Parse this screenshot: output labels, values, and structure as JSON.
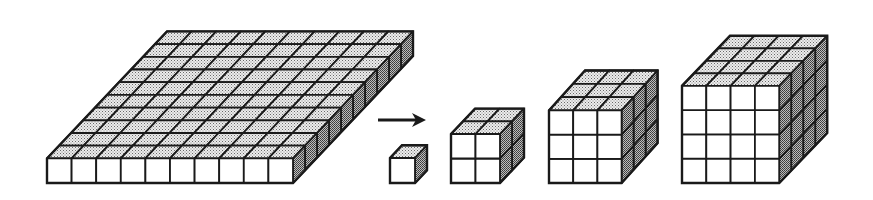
{
  "diagram": {
    "colors": {
      "stroke": "#1a1a1a",
      "front_face": "#ffffff",
      "top_face": "#d9d9d9",
      "side_face": "#9a9a9a",
      "background": "#ffffff"
    },
    "slab": {
      "cols": 10,
      "rows": 10,
      "layers": 1,
      "x": 47,
      "y_bottom": 183,
      "unit": 24.6,
      "dx": 12,
      "dy": -12.7
    },
    "arrow": {
      "x1": 378,
      "y1": 120,
      "x2": 426,
      "y2": 120,
      "direction": "right"
    },
    "cubes": [
      {
        "name": "cube-1",
        "n": 1,
        "x": 390,
        "y_bottom": 183,
        "unit": 25,
        "dx": 12,
        "dy": -12.7
      },
      {
        "name": "cube-2",
        "n": 2,
        "x": 451,
        "y_bottom": 183,
        "unit": 24.5,
        "dx": 12,
        "dy": -12.7
      },
      {
        "name": "cube-3",
        "n": 3,
        "x": 549,
        "y_bottom": 183,
        "unit": 24.2,
        "dx": 12,
        "dy": -13.3
      },
      {
        "name": "cube-4",
        "n": 4,
        "x": 682,
        "y_bottom": 183,
        "unit": 24.3,
        "dx": 12,
        "dy": -12.5
      }
    ]
  }
}
